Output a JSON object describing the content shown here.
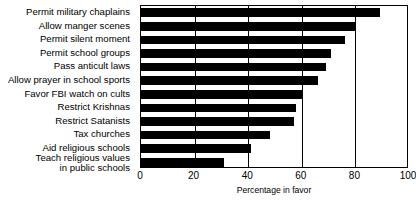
{
  "chart_data": {
    "type": "bar",
    "orientation": "horizontal",
    "title": "",
    "xlabel": "Percentage in favor",
    "ylabel": "",
    "xlim": [
      0,
      100
    ],
    "xticks": [
      0,
      20,
      40,
      60,
      80,
      100
    ],
    "grid": true,
    "legend": false,
    "bar_color": "#000000",
    "categories": [
      "Permit military chaplains",
      "Allow manger scenes",
      "Permit silent moment",
      "Permit school groups",
      "Pass anticult laws",
      "Allow prayer in school sports",
      "Favor FBI watch on cults",
      "Restrict Krishnas",
      "Restrict Satanists",
      "Tax churches",
      "Aid religious schools",
      "Teach religious values\nin public schools"
    ],
    "values": [
      89,
      80,
      76,
      71,
      69,
      66,
      60,
      58,
      57,
      48,
      41,
      31
    ]
  }
}
